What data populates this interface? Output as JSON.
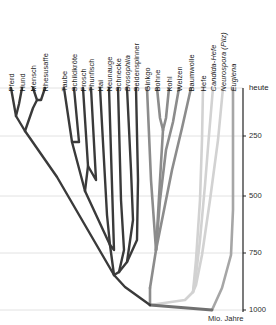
{
  "figure": {
    "title_present": false,
    "today_label": "heute",
    "axis_caption": "Mio. Jahre"
  },
  "colors": {
    "animals": "#3a3a3a",
    "plants": "#8c8c8c",
    "fungi": "#d2d2d2",
    "euglena": "#a6a6a6",
    "root": "#707070",
    "gridline": "#e2e2e2",
    "axis": "#222222",
    "text": "#1a1a1a"
  },
  "axis": {
    "label": "Mio. Jahre",
    "ticks": [
      {
        "value": "250",
        "y": 136
      },
      {
        "value": "500",
        "y": 196
      },
      {
        "value": "750",
        "y": 253
      },
      {
        "value": "1000",
        "y": 310
      }
    ],
    "top_label": "heute",
    "x": 243,
    "y_top": 88,
    "y_bottom": 312
  },
  "chart_data": {
    "type": "diagram",
    "subtype": "phylogenetic-tree",
    "title": "",
    "xlabel": "",
    "ylabel": "Mio. Jahre",
    "ylim": [
      0,
      1000
    ],
    "grid": true,
    "legend": "none",
    "axis_tick_labels": [
      "250",
      "500",
      "750",
      "1000"
    ],
    "axis_top_label": "heute",
    "groups": [
      {
        "name": "Tiere",
        "color": "#3a3a3a",
        "taxa": [
          "Pferd",
          "Hund",
          "Mensch",
          "Rhesusaffe",
          "Taube",
          "Schildkröte",
          "Frosch",
          "Thunfisch",
          "Hai",
          "Neunauge",
          "Schnecke",
          "Drosophila",
          "Seidenspinner"
        ]
      },
      {
        "name": "Pflanzen",
        "color": "#8c8c8c",
        "taxa": [
          "Ginkgo",
          "Bohne",
          "Kohl",
          "Weizen",
          "Baumwolle"
        ]
      },
      {
        "name": "Pilze",
        "color": "#d2d2d2",
        "taxa": [
          "Hefe",
          "Candida-Hefe",
          "Neurospora (Pilz)"
        ]
      },
      {
        "name": "Protisten",
        "color": "#a6a6a6",
        "taxa": [
          "Euglena"
        ]
      }
    ],
    "tips": [
      {
        "label": "Pferd",
        "x": 11,
        "italic": false,
        "group": "Tiere"
      },
      {
        "label": "Hund",
        "x": 22,
        "italic": false,
        "group": "Tiere"
      },
      {
        "label": "Mensch",
        "x": 33,
        "italic": false,
        "group": "Tiere"
      },
      {
        "label": "Rhesusaffe",
        "x": 45,
        "italic": false,
        "group": "Tiere"
      },
      {
        "label": "Taube",
        "x": 64,
        "italic": false,
        "group": "Tiere"
      },
      {
        "label": "Schildkröte",
        "x": 74,
        "italic": false,
        "group": "Tiere"
      },
      {
        "label": "Frosch",
        "x": 83,
        "italic": false,
        "group": "Tiere"
      },
      {
        "label": "Thunfisch",
        "x": 91,
        "italic": false,
        "group": "Tiere"
      },
      {
        "label": "Hai",
        "x": 100,
        "italic": false,
        "group": "Tiere"
      },
      {
        "label": "Neunauge",
        "x": 109,
        "italic": false,
        "group": "Tiere"
      },
      {
        "label": "Schnecke",
        "x": 118,
        "italic": false,
        "group": "Tiere"
      },
      {
        "label": "Drosophila",
        "x": 127,
        "italic": true,
        "group": "Tiere"
      },
      {
        "label": "Seidenspinner",
        "x": 136,
        "italic": false,
        "group": "Tiere"
      },
      {
        "label": "Ginkgo",
        "x": 147,
        "italic": false,
        "group": "Pflanzen"
      },
      {
        "label": "Bohne",
        "x": 157,
        "italic": false,
        "group": "Pflanzen"
      },
      {
        "label": "Kohl",
        "x": 169,
        "italic": false,
        "group": "Pflanzen"
      },
      {
        "label": "Weizen",
        "x": 179,
        "italic": false,
        "group": "Pflanzen"
      },
      {
        "label": "Baumwolle",
        "x": 191,
        "italic": false,
        "group": "Pflanzen"
      },
      {
        "label": "Hefe",
        "x": 203,
        "italic": false,
        "group": "Pilze"
      },
      {
        "label": "Candida-Hefe",
        "x": 213,
        "italic": true,
        "group": "Pilze"
      },
      {
        "label": "Neurospora (Pilz)",
        "x": 223,
        "italic": true,
        "group": "Pilze"
      },
      {
        "label": "Euglena",
        "x": 233,
        "italic": true,
        "group": "Protisten"
      }
    ],
    "branch_paths": {
      "animals": [
        "M11,88 L16,116 L25,131",
        "M22,88 L19,104 L16,116",
        "M33,88 L37,100 L33,108 L25,131",
        "M45,88 L41,100 L37,100",
        "M25,131 L57,177 L114,275",
        "M64,88 L72,142 L85,191",
        "M74,88 L79,142 L72,142",
        "M83,88 L88,166 L85,191",
        "M91,88 L96,180 L88,166",
        "M85,191 L110,245",
        "M100,88 L107,215 L110,245",
        "M109,88 L114,250 L110,245",
        "M110,245 L114,275",
        "M118,88 L121,200 L124,250 L119,272",
        "M127,88 L131,170 L133,220 L127,262 L119,272",
        "M136,88 L138,180 L137,240 L127,262",
        "M119,272 L114,275",
        "M114,275 L125,287 L150,305"
      ],
      "plants": [
        "M147,88 L151,180 L156,250 L150,288",
        "M157,88 L160,118 L163,130",
        "M169,88 L166,118 L163,130",
        "M163,130 L160,180 L156,250",
        "M179,88 L173,122 L166,150 L160,200 L156,250",
        "M191,88 L182,128 L172,170 L162,220 L156,250",
        "M150,288 L150,305"
      ],
      "fungi": [
        "M203,88 L202,140 L200,200 L196,260 L193,292",
        "M213,88 L209,135 L205,185 L200,240 L196,275 L193,292",
        "M223,88 L218,140 L210,200 L202,255 L196,285 L193,292",
        "M193,292 L185,300 L150,305"
      ],
      "euglena": [
        "M233,88 L233,150 L233,210 L231,255 L222,288 L212,310"
      ],
      "root": [
        "M150,305 L212,310"
      ]
    }
  }
}
